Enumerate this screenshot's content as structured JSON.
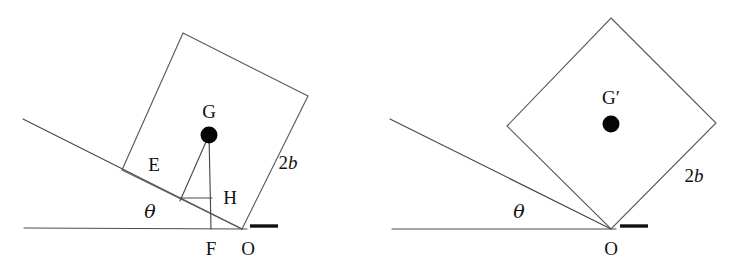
{
  "figure": {
    "type": "line-diagram",
    "background_color": "#ffffff",
    "line_color": "#4a4a4a",
    "marker_color": "#050505",
    "panels": [
      {
        "id": "left-panel",
        "name": "tilted-block-panel",
        "block": {
          "name": "square-block",
          "vertices": [
            [
              183,
              33
            ],
            [
              308,
              96
            ],
            [
              242,
              229
            ],
            [
              122,
              170
            ]
          ]
        },
        "ground_line": [
          [
            24,
            228
          ],
          [
            247,
            229
          ]
        ],
        "incline_line": [
          [
            23,
            119
          ],
          [
            242,
            229
          ]
        ],
        "pivot": {
          "label": "O",
          "x": 242,
          "y": 229,
          "label_x": 248,
          "label_y": 255
        },
        "foot": {
          "label": "F",
          "x": 211,
          "y": 229,
          "label_x": 211,
          "label_y": 255
        },
        "center_of_gravity": {
          "label": "G",
          "dot_x": 209,
          "dot_y": 135,
          "dot_r": 8.5,
          "label_x": 209,
          "label_y": 118
        },
        "segments": [
          {
            "name": "cg-to-foot-vertical",
            "from": [
              209,
              135
            ],
            "to": [
              211,
              229
            ]
          },
          {
            "name": "cg-to-incline-perpendicular",
            "from": [
              209,
              135
            ],
            "to": [
              180,
              201
            ]
          },
          {
            "name": "h-horizontal-tick",
            "from": [
              180,
              198
            ],
            "to": [
              212,
              198
            ]
          }
        ],
        "angle_label": {
          "label": "θ",
          "x": 150,
          "y": 218
        },
        "side_label": {
          "label": "2b",
          "x": 288,
          "y": 169
        },
        "edge_labels": [
          {
            "label": "E",
            "x": 154,
            "y": 171
          },
          {
            "label": "H",
            "x": 230,
            "y": 204
          }
        ],
        "support_mark": {
          "name": "ground-support-mark",
          "from": [
            250,
            226
          ],
          "to": [
            278,
            226
          ]
        }
      },
      {
        "id": "right-panel",
        "name": "balanced-block-panel",
        "block": {
          "name": "square-block-rotated",
          "vertices": [
            [
              611,
              18
            ],
            [
              716,
              123
            ],
            [
              611,
              229
            ],
            [
              507,
              126
            ]
          ]
        },
        "ground_line": [
          [
            392,
            229
          ],
          [
            616,
            229
          ]
        ],
        "incline_line": [
          [
            390,
            119
          ],
          [
            611,
            229
          ]
        ],
        "pivot": {
          "label": "O",
          "x": 611,
          "y": 229,
          "label_x": 611,
          "label_y": 255
        },
        "center_of_gravity": {
          "label": "G′",
          "dot_x": 611,
          "dot_y": 124,
          "dot_r": 8.5,
          "label_x": 611,
          "label_y": 104
        },
        "angle_label": {
          "label": "θ",
          "x": 519,
          "y": 218
        },
        "side_label": {
          "label": "2b",
          "x": 694,
          "y": 182
        },
        "support_mark": {
          "name": "ground-support-mark",
          "from": [
            620,
            226
          ],
          "to": [
            648,
            226
          ]
        }
      }
    ]
  }
}
